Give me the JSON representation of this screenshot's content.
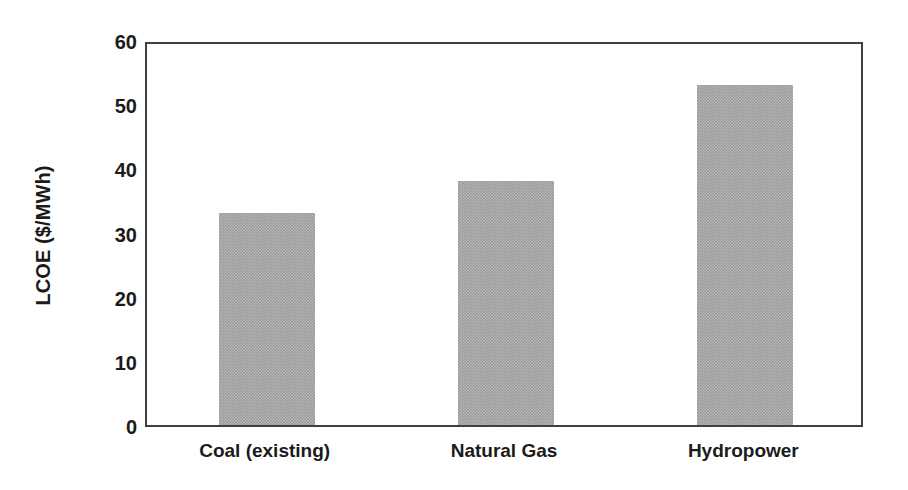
{
  "chart_data": {
    "type": "bar",
    "title": "",
    "subtitle": "",
    "xlabel": "",
    "ylabel": "LCOE ($/MWh)",
    "categories": [
      "Coal (existing)",
      "Natural Gas",
      "Hydropower"
    ],
    "values": [
      33,
      38,
      53
    ],
    "ylim": [
      0,
      60
    ],
    "yticks": [
      0,
      10,
      20,
      30,
      40,
      50,
      60
    ],
    "ytick_labels": [
      "0",
      "10",
      "20",
      "30",
      "40",
      "50",
      "60"
    ],
    "grid": false,
    "legend": null,
    "legend_position": "none",
    "series": [
      {
        "name": "LCOE",
        "values": [
          33,
          38,
          53
        ],
        "color": "#9a9a9a"
      }
    ],
    "colors": {
      "bar_fill": "#9a9a9a",
      "axis": "#404040",
      "text": "#1b1b1b",
      "background": "#ffffff"
    },
    "bar_width_fraction": 0.4
  }
}
